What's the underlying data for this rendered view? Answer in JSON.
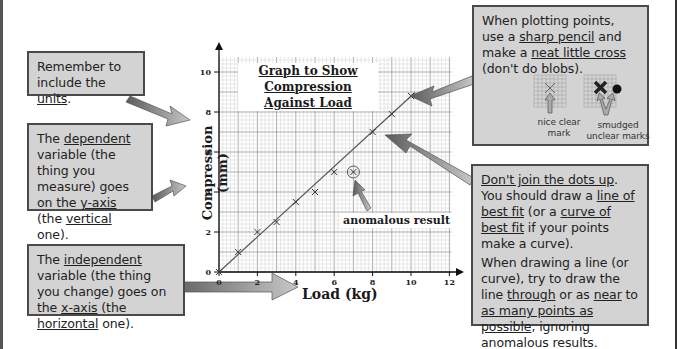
{
  "chart_data": {
    "type": "scatter",
    "title": "Graph to Show Compression Against Load",
    "xlabel": "Load (kg)",
    "ylabel": "Compression (mm)",
    "xlim": [
      0,
      12
    ],
    "ylim": [
      0,
      10
    ],
    "x_ticks": [
      "0",
      "2",
      "4",
      "6",
      "8",
      "10",
      "12"
    ],
    "y_ticks": [
      "0",
      "2",
      "4",
      "6",
      "8",
      "10"
    ],
    "grid": true,
    "points": [
      {
        "x": 0,
        "y": 0
      },
      {
        "x": 1,
        "y": 1
      },
      {
        "x": 2,
        "y": 2
      },
      {
        "x": 3,
        "y": 2.5
      },
      {
        "x": 4,
        "y": 3.5
      },
      {
        "x": 5,
        "y": 4
      },
      {
        "x": 6,
        "y": 5
      },
      {
        "x": 7,
        "y": 5,
        "anomalous": true
      },
      {
        "x": 8,
        "y": 7
      },
      {
        "x": 9,
        "y": 7.9
      },
      {
        "x": 10,
        "y": 8.8
      }
    ],
    "best_fit_line": {
      "from": {
        "x": 0,
        "y": 0
      },
      "to": {
        "x": 10,
        "y": 8.8
      }
    },
    "annotation": "anomalous result"
  },
  "callouts": {
    "units": {
      "text_a": "Remember to include the ",
      "u1": "units",
      "text_b": "."
    },
    "dependent": {
      "t1": "The ",
      "u1": "dependent",
      "t2": " variable (the thing you measure) goes on the ",
      "u2": "y-axis",
      "t3": " (the ",
      "u3": "vertical",
      "t4": " one)."
    },
    "independent": {
      "t1": "The ",
      "u1": "independent",
      "t2": " variable (the thing you change) goes on the ",
      "u2": "x-axis",
      "t3": " (the ",
      "u3": "horizontal",
      "t4": " one)."
    },
    "plotting": {
      "t1": "When plotting points, use a ",
      "u1": "sharp pencil",
      "t2": " and make a ",
      "u2": "neat little cross",
      "t3": " (don't do blobs).",
      "good_caption": "nice clear mark",
      "bad_caption": "smudged unclear marks"
    },
    "bestfit": {
      "u1": "Don't join the dots up",
      "t1": ". You should draw a ",
      "u2": "line of best fit",
      "t2": " (or a ",
      "u3": "curve of best fit",
      "t3": " if your points make a curve).",
      "p2_t1": "When drawing a line (or curve), try to draw the line ",
      "p2_u1": "through",
      "p2_t2": " or as ",
      "p2_u2": "near",
      "p2_t3": " to ",
      "p2_u3": "as many points as possible",
      "p2_t4": ", ignoring anomalous results."
    }
  },
  "colors": {
    "callout_bg": "#d3d3d3",
    "callout_border": "#4a4a4a",
    "arrow": "#8a8a8a",
    "grid": "#bdbdbd"
  }
}
